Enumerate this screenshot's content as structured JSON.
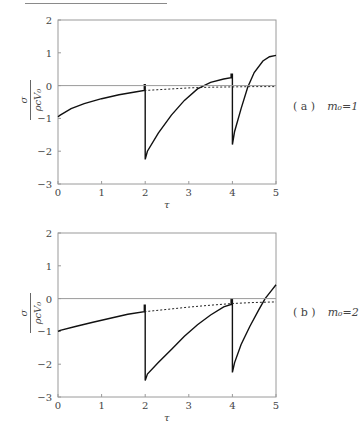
{
  "chart_data": [
    {
      "type": "line",
      "panel": "a",
      "caption_label": "( a )",
      "caption_param": "m₀=1",
      "xlabel": "τ",
      "ylabel_num": "σ",
      "ylabel_den": "ρcV₀",
      "xlim": [
        0,
        5
      ],
      "ylim": [
        -3,
        2
      ],
      "xticks": [
        "0",
        "1",
        "2",
        "3",
        "4",
        "5"
      ],
      "yticks": [
        "2",
        "1",
        "0",
        "−1",
        "−2",
        "−3"
      ],
      "grid": false,
      "series": [
        {
          "name": "solid",
          "style": "solid",
          "points": [
            [
              0,
              -0.95
            ],
            [
              0.05,
              -0.9
            ],
            [
              0.3,
              -0.7
            ],
            [
              0.6,
              -0.55
            ],
            [
              1.0,
              -0.4
            ],
            [
              1.4,
              -0.28
            ],
            [
              1.8,
              -0.19
            ],
            [
              1.98,
              -0.15
            ],
            [
              1.98,
              0.03
            ],
            [
              2.0,
              0.03
            ],
            [
              2.0,
              -2.25
            ],
            [
              2.05,
              -2.0
            ],
            [
              2.3,
              -1.45
            ],
            [
              2.6,
              -0.9
            ],
            [
              2.9,
              -0.45
            ],
            [
              3.2,
              -0.1
            ],
            [
              3.5,
              0.1
            ],
            [
              3.8,
              0.2
            ],
            [
              3.97,
              0.24
            ],
            [
              3.97,
              0.35
            ],
            [
              4.0,
              0.35
            ],
            [
              4.0,
              -1.8
            ],
            [
              4.05,
              -1.4
            ],
            [
              4.2,
              -0.7
            ],
            [
              4.35,
              -0.05
            ],
            [
              4.5,
              0.4
            ],
            [
              4.7,
              0.75
            ],
            [
              4.85,
              0.88
            ],
            [
              5.0,
              0.92
            ]
          ]
        },
        {
          "name": "dashed",
          "style": "dashed",
          "points": [
            [
              1.98,
              -0.15
            ],
            [
              2.5,
              -0.11
            ],
            [
              3.0,
              -0.07
            ],
            [
              3.5,
              -0.05
            ],
            [
              4.0,
              -0.04
            ],
            [
              4.5,
              -0.03
            ],
            [
              5.0,
              -0.03
            ]
          ]
        },
        {
          "name": "zero-line",
          "style": "thin",
          "points": [
            [
              0,
              0
            ],
            [
              5,
              0
            ]
          ]
        }
      ]
    },
    {
      "type": "line",
      "panel": "b",
      "caption_label": "( b )",
      "caption_param": "m₀=2",
      "xlabel": "τ",
      "ylabel_num": "σ",
      "ylabel_den": "ρcV₀",
      "xlim": [
        0,
        5
      ],
      "ylim": [
        -3,
        2
      ],
      "xticks": [
        "0",
        "1",
        "2",
        "3",
        "4",
        "5"
      ],
      "yticks": [
        "2",
        "1",
        "0",
        "−1",
        "−2",
        "−3"
      ],
      "grid": false,
      "series": [
        {
          "name": "solid",
          "style": "solid",
          "points": [
            [
              0,
              -1.0
            ],
            [
              0.05,
              -0.97
            ],
            [
              0.4,
              -0.85
            ],
            [
              0.8,
              -0.72
            ],
            [
              1.2,
              -0.6
            ],
            [
              1.6,
              -0.48
            ],
            [
              1.98,
              -0.4
            ],
            [
              1.98,
              -0.2
            ],
            [
              2.0,
              -0.2
            ],
            [
              2.0,
              -2.5
            ],
            [
              2.05,
              -2.3
            ],
            [
              2.3,
              -1.95
            ],
            [
              2.6,
              -1.55
            ],
            [
              2.9,
              -1.15
            ],
            [
              3.2,
              -0.8
            ],
            [
              3.5,
              -0.5
            ],
            [
              3.8,
              -0.25
            ],
            [
              3.97,
              -0.18
            ],
            [
              3.97,
              -0.02
            ],
            [
              4.0,
              -0.02
            ],
            [
              4.0,
              -2.25
            ],
            [
              4.05,
              -1.95
            ],
            [
              4.2,
              -1.4
            ],
            [
              4.4,
              -0.85
            ],
            [
              4.6,
              -0.35
            ],
            [
              4.75,
              0.0
            ],
            [
              4.9,
              0.25
            ],
            [
              5.0,
              0.42
            ]
          ]
        },
        {
          "name": "dashed",
          "style": "dashed",
          "points": [
            [
              1.98,
              -0.4
            ],
            [
              2.5,
              -0.33
            ],
            [
              3.0,
              -0.26
            ],
            [
              3.5,
              -0.2
            ],
            [
              4.0,
              -0.15
            ],
            [
              4.5,
              -0.12
            ],
            [
              5.0,
              -0.1
            ]
          ]
        },
        {
          "name": "zero-line",
          "style": "thin",
          "points": [
            [
              0,
              0
            ],
            [
              5,
              0
            ]
          ]
        }
      ]
    }
  ]
}
